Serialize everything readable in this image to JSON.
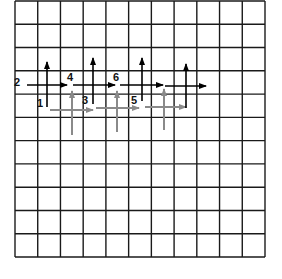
{
  "diagram": {
    "type": "grid-vector-diagram",
    "grid": {
      "columns": 11,
      "rows": 11,
      "left": 15,
      "top": 1,
      "right": 265,
      "bottom": 257,
      "line_color": "#1a1a1a"
    },
    "colors": {
      "black_arrow": "#000000",
      "gray_arrow": "#8a8a8a"
    },
    "labels": [
      {
        "text": "2",
        "x": 14,
        "y": 86
      },
      {
        "text": "1",
        "x": 37,
        "y": 107
      },
      {
        "text": "4",
        "x": 67,
        "y": 81
      },
      {
        "text": "3",
        "x": 82,
        "y": 104
      },
      {
        "text": "6",
        "x": 113,
        "y": 81
      },
      {
        "text": "5",
        "x": 131,
        "y": 104
      }
    ],
    "black_arrows": [
      {
        "id": "v1",
        "x1": 47,
        "y1": 107,
        "x2": 47,
        "y2": 62
      },
      {
        "id": "h1",
        "x1": 27,
        "y1": 85,
        "x2": 67,
        "y2": 85
      },
      {
        "id": "v2",
        "x1": 93,
        "y1": 104,
        "x2": 93,
        "y2": 58
      },
      {
        "id": "h2",
        "x1": 73,
        "y1": 85,
        "x2": 115,
        "y2": 85
      },
      {
        "id": "v3",
        "x1": 142,
        "y1": 101,
        "x2": 142,
        "y2": 58
      },
      {
        "id": "h3",
        "x1": 120,
        "y1": 85,
        "x2": 163,
        "y2": 85
      },
      {
        "id": "v4",
        "x1": 186,
        "y1": 108,
        "x2": 186,
        "y2": 64
      },
      {
        "id": "h4",
        "x1": 165,
        "y1": 86,
        "x2": 206,
        "y2": 86
      }
    ],
    "gray_arrows": [
      {
        "id": "gv1",
        "x1": 72,
        "y1": 135,
        "x2": 72,
        "y2": 91
      },
      {
        "id": "gh1",
        "x1": 50,
        "y1": 110,
        "x2": 93,
        "y2": 110
      },
      {
        "id": "gv2",
        "x1": 117,
        "y1": 132,
        "x2": 117,
        "y2": 91
      },
      {
        "id": "gh2",
        "x1": 96,
        "y1": 108,
        "x2": 139,
        "y2": 108
      },
      {
        "id": "gv3",
        "x1": 164,
        "y1": 130,
        "x2": 164,
        "y2": 89
      },
      {
        "id": "gh3",
        "x1": 145,
        "y1": 107,
        "x2": 186,
        "y2": 107
      }
    ]
  }
}
